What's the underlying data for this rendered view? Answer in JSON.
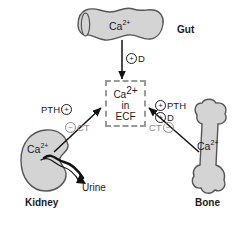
{
  "diagram": {
    "background_color": "#ffffff",
    "organ_fill_color": "#d4d4d4",
    "organ_stroke_color": "#555555",
    "arrow_color": "#111111",
    "inhibit_color": "#8d8d8d",
    "ecf_border_color": "#9a9a9a"
  },
  "central": {
    "name": "ecf-pool",
    "line1": "Ca",
    "line1_sup": "2+",
    "line2": "in",
    "line3": "ECF"
  },
  "organs": [
    {
      "id": "gut",
      "label": "Gut",
      "ion_label": "Ca",
      "ion_sup": "2+"
    },
    {
      "id": "kidney",
      "label": "Kidney",
      "ion_label": "Ca",
      "ion_sup": "2+",
      "output_label": "Urine"
    },
    {
      "id": "bone",
      "label": "Bone",
      "ion_label": "Ca",
      "ion_sup": "2+"
    }
  ],
  "regulators": {
    "gut_arrow": {
      "sign": "+",
      "text": "D"
    },
    "kidney_arrow": {
      "stimulate": {
        "text": "PTH",
        "sign": "+"
      },
      "inhibit": {
        "sign": "-",
        "text": "CT"
      }
    },
    "bone_arrow": {
      "stimulate_1": {
        "sign": "+",
        "text": "PTH"
      },
      "stimulate_2": {
        "sign": "+",
        "text": "D"
      },
      "inhibit": {
        "text": "CT",
        "sign": "-"
      }
    }
  },
  "symbols": {
    "plus": "+",
    "minus": "−"
  }
}
